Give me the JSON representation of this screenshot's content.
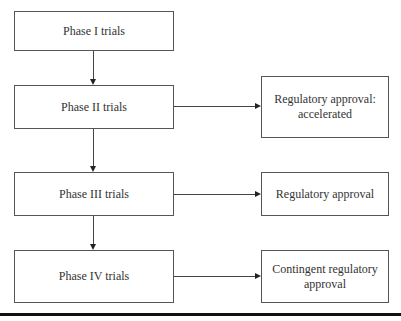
{
  "diagram": {
    "phases": [
      {
        "label": "Phase I trials"
      },
      {
        "label": "Phase II trials"
      },
      {
        "label": "Phase III trials"
      },
      {
        "label": "Phase IV trials"
      }
    ],
    "outcomes": [
      {
        "label": "Regulatory approval: accelerated",
        "from": "Phase II trials"
      },
      {
        "label": "Regulatory approval",
        "from": "Phase III trials"
      },
      {
        "label": "Contingent regulatory approval",
        "from": "Phase IV trials"
      }
    ]
  }
}
